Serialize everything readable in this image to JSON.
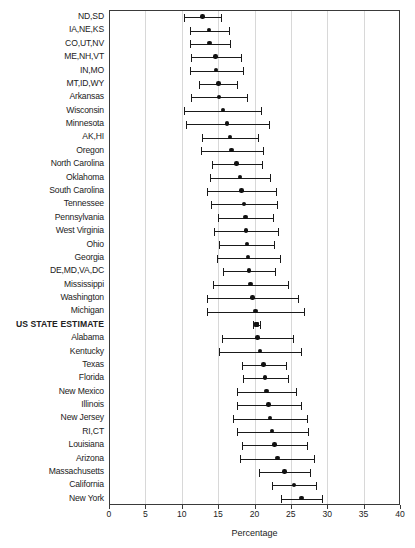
{
  "chart_data": {
    "type": "scatter",
    "title": "",
    "subtitle": "",
    "xlabel": "Percentage",
    "ylabel": "",
    "xlim": [
      0,
      40
    ],
    "xticks": [
      0,
      5,
      10,
      15,
      20,
      25,
      30,
      35,
      40
    ],
    "xtick_labels": [
      "0",
      "5",
      "10",
      "15",
      "20",
      "25",
      "30",
      "35",
      "40"
    ],
    "grid": "vertical",
    "legend": "none",
    "marker_color": "#111111",
    "error_bar_color": "#1a1a1a",
    "annotation": "Point estimates with 95% confidence interval whiskers, sorted ascending; the pooled US STATE ESTIMATE row is bolded and uses a square marker.",
    "categories": [
      "ND,SD",
      "IA,NE,KS",
      "CO,UT,NV",
      "ME,NH,VT",
      "IN,MO",
      "MT,ID,WY",
      "Arkansas",
      "Wisconsin",
      "Minnesota",
      "AK,HI",
      "Oregon",
      "North Carolina",
      "Oklahoma",
      "South Carolina",
      "Tennessee",
      "Pennsylvania",
      "West Virginia",
      "Ohio",
      "Georgia",
      "DE,MD,VA,DC",
      "Mississippi",
      "Washington",
      "Michigan",
      "US STATE ESTIMATE",
      "Alabama",
      "Kentucky",
      "Texas",
      "Florida",
      "New Mexico",
      "Illinois",
      "New Jersey",
      "RI,CT",
      "Louisiana",
      "Arizona",
      "Massachusetts",
      "California",
      "New York"
    ],
    "points": [
      {
        "label": "ND,SD",
        "value": 12.7,
        "low": 10.2,
        "high": 15.2,
        "emphasis": false,
        "marker": "circle"
      },
      {
        "label": "IA,NE,KS",
        "value": 13.6,
        "low": 11.0,
        "high": 16.3,
        "emphasis": false,
        "marker": "circle"
      },
      {
        "label": "CO,UT,NV",
        "value": 13.7,
        "low": 11.0,
        "high": 16.5,
        "emphasis": false,
        "marker": "circle"
      },
      {
        "label": "ME,NH,VT",
        "value": 14.5,
        "low": 11.2,
        "high": 18.0,
        "emphasis": false,
        "marker": "circle"
      },
      {
        "label": "IN,MO",
        "value": 14.6,
        "low": 11.0,
        "high": 18.3,
        "emphasis": false,
        "marker": "circle"
      },
      {
        "label": "MT,ID,WY",
        "value": 14.9,
        "low": 12.3,
        "high": 17.4,
        "emphasis": false,
        "marker": "circle"
      },
      {
        "label": "Arkansas",
        "value": 15.0,
        "low": 11.1,
        "high": 18.9,
        "emphasis": false,
        "marker": "circle"
      },
      {
        "label": "Wisconsin",
        "value": 15.5,
        "low": 10.2,
        "high": 20.8,
        "emphasis": false,
        "marker": "circle"
      },
      {
        "label": "Minnesota",
        "value": 16.1,
        "low": 10.4,
        "high": 21.8,
        "emphasis": false,
        "marker": "circle"
      },
      {
        "label": "AK,HI",
        "value": 16.5,
        "low": 12.6,
        "high": 20.4,
        "emphasis": false,
        "marker": "circle"
      },
      {
        "label": "Oregon",
        "value": 16.7,
        "low": 12.5,
        "high": 21.0,
        "emphasis": false,
        "marker": "circle"
      },
      {
        "label": "North Carolina",
        "value": 17.4,
        "low": 14.0,
        "high": 20.9,
        "emphasis": false,
        "marker": "circle"
      },
      {
        "label": "Oklahoma",
        "value": 17.9,
        "low": 13.8,
        "high": 22.0,
        "emphasis": false,
        "marker": "circle"
      },
      {
        "label": "South Carolina",
        "value": 18.1,
        "low": 13.4,
        "high": 22.8,
        "emphasis": false,
        "marker": "circle"
      },
      {
        "label": "Tennessee",
        "value": 18.4,
        "low": 13.9,
        "high": 23.0,
        "emphasis": false,
        "marker": "circle"
      },
      {
        "label": "Pennsylvania",
        "value": 18.6,
        "low": 14.8,
        "high": 22.4,
        "emphasis": false,
        "marker": "circle"
      },
      {
        "label": "West Virginia",
        "value": 18.7,
        "low": 14.3,
        "high": 23.1,
        "emphasis": false,
        "marker": "circle"
      },
      {
        "label": "Ohio",
        "value": 18.8,
        "low": 15.0,
        "high": 22.6,
        "emphasis": false,
        "marker": "circle"
      },
      {
        "label": "Georgia",
        "value": 19.0,
        "low": 14.7,
        "high": 23.3,
        "emphasis": false,
        "marker": "circle"
      },
      {
        "label": "DE,MD,VA,DC",
        "value": 19.1,
        "low": 15.5,
        "high": 22.7,
        "emphasis": false,
        "marker": "circle"
      },
      {
        "label": "Mississippi",
        "value": 19.3,
        "low": 14.2,
        "high": 24.4,
        "emphasis": false,
        "marker": "circle"
      },
      {
        "label": "Washington",
        "value": 19.6,
        "low": 13.3,
        "high": 25.9,
        "emphasis": false,
        "marker": "circle"
      },
      {
        "label": "Michigan",
        "value": 20.0,
        "low": 13.4,
        "high": 26.6,
        "emphasis": false,
        "marker": "circle"
      },
      {
        "label": "US STATE ESTIMATE",
        "value": 20.1,
        "low": 19.6,
        "high": 20.6,
        "emphasis": true,
        "marker": "square"
      },
      {
        "label": "Alabama",
        "value": 20.3,
        "low": 15.4,
        "high": 25.2,
        "emphasis": false,
        "marker": "circle"
      },
      {
        "label": "Kentucky",
        "value": 20.6,
        "low": 15.0,
        "high": 26.2,
        "emphasis": false,
        "marker": "circle"
      },
      {
        "label": "Texas",
        "value": 21.1,
        "low": 18.1,
        "high": 24.2,
        "emphasis": false,
        "marker": "circle"
      },
      {
        "label": "Florida",
        "value": 21.3,
        "low": 18.3,
        "high": 24.4,
        "emphasis": false,
        "marker": "circle"
      },
      {
        "label": "New Mexico",
        "value": 21.5,
        "low": 17.5,
        "high": 25.6,
        "emphasis": false,
        "marker": "circle"
      },
      {
        "label": "Illinois",
        "value": 21.8,
        "low": 17.4,
        "high": 26.2,
        "emphasis": false,
        "marker": "circle"
      },
      {
        "label": "New Jersey",
        "value": 22.0,
        "low": 16.9,
        "high": 27.1,
        "emphasis": false,
        "marker": "circle"
      },
      {
        "label": "RI,CT",
        "value": 22.3,
        "low": 17.4,
        "high": 27.2,
        "emphasis": false,
        "marker": "circle"
      },
      {
        "label": "Louisiana",
        "value": 22.6,
        "low": 18.1,
        "high": 27.1,
        "emphasis": false,
        "marker": "circle"
      },
      {
        "label": "Arizona",
        "value": 23.0,
        "low": 17.9,
        "high": 28.1,
        "emphasis": false,
        "marker": "circle"
      },
      {
        "label": "Massachusetts",
        "value": 24.0,
        "low": 20.5,
        "high": 27.5,
        "emphasis": false,
        "marker": "circle"
      },
      {
        "label": "California",
        "value": 25.3,
        "low": 22.2,
        "high": 28.3,
        "emphasis": false,
        "marker": "circle"
      },
      {
        "label": "New York",
        "value": 26.3,
        "low": 23.5,
        "high": 29.2,
        "emphasis": false,
        "marker": "circle"
      }
    ]
  }
}
